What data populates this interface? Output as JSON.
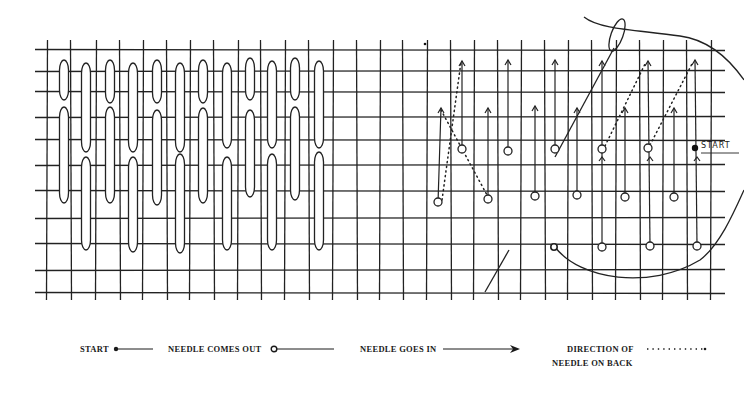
{
  "diagram": {
    "grid": {
      "h_lines_y": [
        50,
        71,
        92,
        117,
        140,
        165,
        191,
        218,
        244,
        270,
        293
      ],
      "v_lines_x": [
        47,
        71,
        96,
        120,
        143,
        167,
        190,
        214,
        238,
        261,
        285,
        309,
        333,
        357,
        380,
        403,
        427,
        451,
        474,
        498,
        521,
        545,
        568,
        592,
        616,
        640,
        663,
        687,
        711
      ],
      "left": 35,
      "right": 725,
      "top": 40,
      "bottom": 300,
      "stroke_color": "#222222"
    },
    "worked_sample": {
      "stitches_top_row": [
        {
          "x": 64,
          "y1": 60,
          "y2": 100
        },
        {
          "x": 86,
          "y1": 63,
          "y2": 152
        },
        {
          "x": 110,
          "y1": 60,
          "y2": 103
        },
        {
          "x": 133,
          "y1": 63,
          "y2": 152
        },
        {
          "x": 157,
          "y1": 60,
          "y2": 103
        },
        {
          "x": 180,
          "y1": 63,
          "y2": 152
        },
        {
          "x": 203,
          "y1": 60,
          "y2": 103
        },
        {
          "x": 227,
          "y1": 63,
          "y2": 148
        },
        {
          "x": 250,
          "y1": 58,
          "y2": 100
        },
        {
          "x": 272,
          "y1": 61,
          "y2": 148
        },
        {
          "x": 295,
          "y1": 58,
          "y2": 100
        },
        {
          "x": 319,
          "y1": 61,
          "y2": 148
        }
      ],
      "stitches_bottom_row": [
        {
          "x": 64,
          "y1": 107,
          "y2": 203
        },
        {
          "x": 86,
          "y1": 157,
          "y2": 250
        },
        {
          "x": 110,
          "y1": 107,
          "y2": 203
        },
        {
          "x": 133,
          "y1": 157,
          "y2": 252
        },
        {
          "x": 157,
          "y1": 110,
          "y2": 205
        },
        {
          "x": 180,
          "y1": 154,
          "y2": 253
        },
        {
          "x": 203,
          "y1": 108,
          "y2": 203
        },
        {
          "x": 227,
          "y1": 157,
          "y2": 250
        },
        {
          "x": 250,
          "y1": 110,
          "y2": 197
        },
        {
          "x": 272,
          "y1": 154,
          "y2": 250
        },
        {
          "x": 295,
          "y1": 107,
          "y2": 200
        },
        {
          "x": 319,
          "y1": 152,
          "y2": 250
        }
      ],
      "stitch_width": 9
    },
    "instruction_sample": {
      "arrows": [
        {
          "x1": 438,
          "y1": 203,
          "x2": 441,
          "y2": 108
        },
        {
          "x1": 462,
          "y1": 148,
          "x2": 462,
          "y2": 61
        },
        {
          "x1": 488,
          "y1": 198,
          "x2": 488,
          "y2": 108
        },
        {
          "x1": 508,
          "y1": 150,
          "x2": 508,
          "y2": 60
        },
        {
          "x1": 535,
          "y1": 195,
          "x2": 535,
          "y2": 106
        },
        {
          "x1": 555,
          "y1": 148,
          "x2": 555,
          "y2": 60
        },
        {
          "x1": 577,
          "y1": 195,
          "x2": 577,
          "y2": 108
        },
        {
          "x1": 602,
          "y1": 247,
          "x2": 602,
          "y2": 61
        },
        {
          "x1": 625,
          "y1": 197,
          "x2": 625,
          "y2": 108
        },
        {
          "x1": 650,
          "y1": 245,
          "x2": 648,
          "y2": 61
        },
        {
          "x1": 674,
          "y1": 197,
          "x2": 674,
          "y2": 108
        },
        {
          "x1": 697,
          "y1": 245,
          "x2": 695,
          "y2": 60
        }
      ],
      "small_arrows_up": [
        {
          "x": 602,
          "y": 157
        },
        {
          "x": 650,
          "y": 157
        },
        {
          "x": 697,
          "y": 157
        }
      ],
      "needle_out_circles": [
        {
          "cx": 438,
          "cy": 202
        },
        {
          "cx": 462,
          "cy": 149
        },
        {
          "cx": 488,
          "cy": 199
        },
        {
          "cx": 508,
          "cy": 151
        },
        {
          "cx": 535,
          "cy": 196
        },
        {
          "cx": 555,
          "cy": 149
        },
        {
          "cx": 577,
          "cy": 195
        },
        {
          "cx": 602,
          "cy": 149
        },
        {
          "cx": 625,
          "cy": 197
        },
        {
          "cx": 602,
          "cy": 247
        },
        {
          "cx": 650,
          "cy": 246
        },
        {
          "cx": 674,
          "cy": 197
        },
        {
          "cx": 697,
          "cy": 246
        },
        {
          "cx": 648,
          "cy": 148
        }
      ],
      "dotted_back_paths": [
        {
          "x1": 442,
          "y1": 200,
          "x2": 461,
          "y2": 62
        },
        {
          "x1": 441,
          "y1": 110,
          "x2": 487,
          "y2": 195
        },
        {
          "x1": 605,
          "y1": 146,
          "x2": 646,
          "y2": 62
        },
        {
          "x1": 650,
          "y1": 145,
          "x2": 693,
          "y2": 62
        }
      ],
      "start_point": {
        "cx": 695,
        "cy": 148
      },
      "start_label": "START",
      "thread_curves": [
        "M 584 17 C 600 30, 640 30, 680 36 C 710 40, 730 60, 744 80",
        "M 555 247 C 580 280, 650 290, 700 260 C 720 245, 735 210, 744 190"
      ],
      "needle_top": {
        "cx": 617,
        "cy": 35,
        "rx": 6,
        "ry": 17,
        "rotate": 20
      },
      "needle_line": {
        "x1": 555,
        "y1": 157,
        "x2": 614,
        "y2": 48
      },
      "bottom_needle_line": {
        "x1": 485,
        "y1": 292,
        "x2": 509,
        "y2": 250
      },
      "small_dot": {
        "cx": 425,
        "cy": 44
      },
      "bottom_start_circle": {
        "cx": 554,
        "cy": 247
      }
    }
  },
  "legend": {
    "start_label": "START",
    "needle_comes_out_label": "NEEDLE COMES OUT",
    "needle_goes_in_label": "NEEDLE GOES IN",
    "direction_line1": "DIRECTION OF",
    "direction_line2": "NEEDLE ON BACK"
  },
  "colors": {
    "ink": "#1a1a1a",
    "paper": "#ffffff",
    "grid": "#222222"
  }
}
